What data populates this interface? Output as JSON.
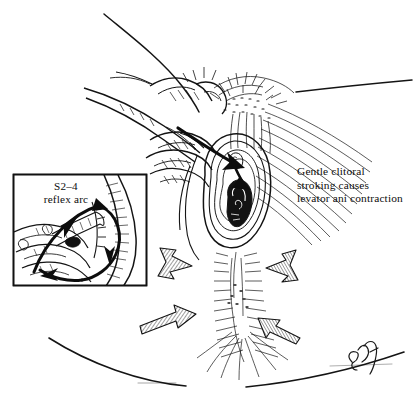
{
  "figure": {
    "kind": "pen-and-ink medical illustration",
    "background_color": "#ffffff",
    "ink_color": "#111111"
  },
  "caption": {
    "line1": "Gentle clitoral",
    "line2": "stroking causes",
    "line3": "levator ani contraction"
  },
  "inset": {
    "label_line1": "S2–4",
    "label_line2": "reflex arc",
    "border_color": "#111111",
    "box": {
      "x": 13,
      "y": 174,
      "width": 134,
      "height": 112
    }
  },
  "annotations": {
    "signature": "artist-signature",
    "stimulus_arrow": "solid-black-stroking-arrow",
    "contraction_arrows": [
      "hatched-arrow-upper-left",
      "hatched-arrow-upper-right",
      "hatched-arrow-lower-left",
      "hatched-arrow-lower-right"
    ],
    "reflex_arrows": [
      "afferent-limb-arrow",
      "efferent-limb-arrow"
    ]
  }
}
